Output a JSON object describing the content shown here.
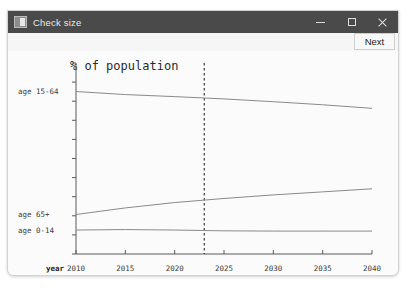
{
  "window": {
    "title": "Check size",
    "icon": "app-window-icon",
    "controls": {
      "minimize": "minimize-icon",
      "maximize": "maximize-icon",
      "close": "close-icon"
    }
  },
  "toolbar": {
    "next_label": "Next"
  },
  "chart_data": {
    "type": "line",
    "title": "% of population",
    "xlabel": "year",
    "ylabel": "",
    "grid": false,
    "legend": "inline-left-labels",
    "xlim": [
      2010,
      2040
    ],
    "xticks": [
      2010,
      2015,
      2020,
      2025,
      2030,
      2035,
      2040
    ],
    "xtick_labels": [
      "2010",
      "2015",
      "2020",
      "2025",
      "2030",
      "2035",
      "2040"
    ],
    "ylim": [
      0,
      75
    ],
    "yticks": [
      0,
      7.5,
      15,
      22.5,
      30,
      37.5,
      45,
      52.5,
      60,
      67.5,
      75
    ],
    "annotations": [
      {
        "name": "current-year-marker",
        "type": "vline",
        "x": 2023,
        "style": "dashed"
      }
    ],
    "x": [
      2010,
      2015,
      2020,
      2025,
      2030,
      2035,
      2040
    ],
    "series": [
      {
        "name": "age 15-64",
        "label": "age 15-64",
        "values": [
          63.8,
          62.6,
          61.8,
          60.9,
          59.8,
          58.6,
          57.2
        ]
      },
      {
        "name": "age 65+",
        "label": "age 65+",
        "values": [
          15.5,
          18.1,
          20.2,
          21.8,
          23.2,
          24.4,
          25.6
        ]
      },
      {
        "name": "age 0-14",
        "label": "age 0-14",
        "values": [
          9.4,
          9.6,
          9.4,
          9.1,
          9.0,
          9.0,
          9.0
        ]
      }
    ]
  }
}
